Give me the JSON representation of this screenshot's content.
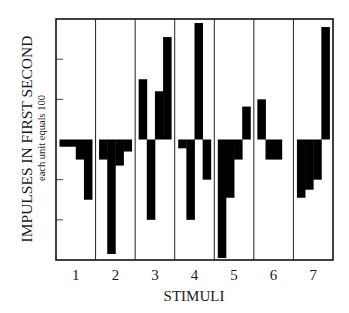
{
  "chart_data": {
    "type": "bar",
    "title": "",
    "ylabel": "IMPULSES IN FIRST SECOND",
    "ylabel_sub": "each unit equals 100",
    "xlabel": "STIMULI",
    "ylim": [
      -3,
      3
    ],
    "yticks": [
      -2,
      -1,
      1,
      2
    ],
    "ytick_labels_shown": false,
    "grid": false,
    "legend": "none",
    "bar_color": "#000000",
    "categories": [
      "1",
      "2",
      "3",
      "4",
      "5",
      "6",
      "7"
    ],
    "groups": [
      {
        "stimulus": "1",
        "bars": [
          -0.18,
          -0.5,
          -1.5
        ]
      },
      {
        "stimulus": "2",
        "bars": [
          -0.5,
          -2.85,
          -0.65,
          -0.3
        ]
      },
      {
        "stimulus": "3",
        "bars": [
          1.5,
          -2.0,
          1.2,
          2.55
        ]
      },
      {
        "stimulus": "4",
        "bars": [
          -0.22,
          -2.0,
          2.9,
          -1.0
        ]
      },
      {
        "stimulus": "5",
        "bars": [
          -2.95,
          -1.45,
          -0.5,
          0.82
        ]
      },
      {
        "stimulus": "6",
        "bars": [
          1.0,
          -0.5,
          -0.5
        ]
      },
      {
        "stimulus": "7",
        "bars": [
          -1.45,
          -1.25,
          -1.0,
          2.8
        ]
      }
    ]
  }
}
